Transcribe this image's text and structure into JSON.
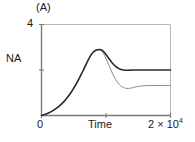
{
  "panel": {
    "label": "(A)"
  },
  "axes": {
    "ylabel": "NA",
    "ytick_top": "4",
    "xtick_zero": "0",
    "xlabel": "Time",
    "xtick_max_mantissa": "2 × 10",
    "xtick_max_exponent": "4"
  },
  "colors": {
    "axis": "#7a7a7a",
    "frame_light": "#b8b8b8",
    "curve_upper": "#2b2b2b",
    "curve_lower": "#8c8c8c",
    "text": "#1a1a1a",
    "background": "#ffffff"
  },
  "chart_data": {
    "type": "line",
    "title": "(A)",
    "xlabel": "Time",
    "ylabel": "NA",
    "xlim": [
      0,
      20000
    ],
    "ylim": [
      0,
      4
    ],
    "xticks": [
      0,
      20000
    ],
    "xticklabels": [
      "0",
      "2 × 10⁴"
    ],
    "yticks": [
      0,
      2,
      4
    ],
    "yticklabels": [
      "",
      "",
      "4"
    ],
    "grid": false,
    "legend": false,
    "series": [
      {
        "name": "upper",
        "x": [
          0,
          500,
          1000,
          1500,
          2000,
          2500,
          3000,
          3500,
          4000,
          4500,
          5000,
          5500,
          6000,
          6500,
          7000,
          7500,
          8000,
          8500,
          9000,
          9200,
          9500,
          10000,
          10500,
          11000,
          11500,
          12000,
          12500,
          13000,
          13500,
          14000,
          15000,
          16000,
          17000,
          18000,
          19000,
          20000
        ],
        "y": [
          0.0,
          0.04,
          0.1,
          0.17,
          0.26,
          0.36,
          0.48,
          0.62,
          0.79,
          0.98,
          1.2,
          1.45,
          1.72,
          2.0,
          2.3,
          2.58,
          2.78,
          2.88,
          2.9,
          2.89,
          2.84,
          2.68,
          2.48,
          2.3,
          2.16,
          2.06,
          2.01,
          1.99,
          1.99,
          2.0,
          2.0,
          2.0,
          2.0,
          2.0,
          2.0,
          2.0
        ]
      },
      {
        "name": "lower",
        "x": [
          0,
          500,
          1000,
          1500,
          2000,
          2500,
          3000,
          3500,
          4000,
          4500,
          5000,
          5500,
          6000,
          6500,
          7000,
          7500,
          8000,
          8500,
          9000,
          9200,
          9500,
          10000,
          10500,
          11000,
          11500,
          12000,
          12500,
          13000,
          13500,
          14000,
          15000,
          16000,
          17000,
          18000,
          19000,
          20000
        ],
        "y": [
          0.0,
          0.04,
          0.1,
          0.17,
          0.26,
          0.36,
          0.48,
          0.62,
          0.79,
          0.98,
          1.2,
          1.45,
          1.72,
          2.0,
          2.3,
          2.58,
          2.78,
          2.87,
          2.88,
          2.86,
          2.78,
          2.5,
          2.18,
          1.85,
          1.58,
          1.38,
          1.26,
          1.2,
          1.19,
          1.21,
          1.28,
          1.31,
          1.32,
          1.32,
          1.32,
          1.32
        ]
      }
    ]
  }
}
